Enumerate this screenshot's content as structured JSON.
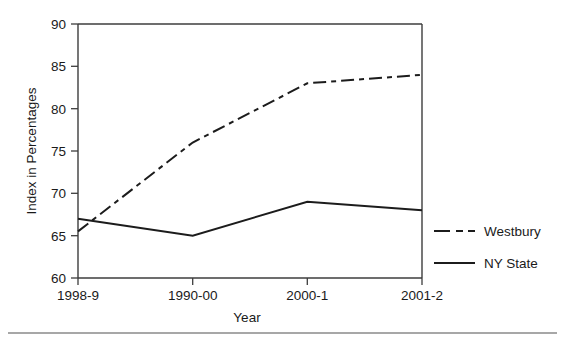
{
  "chart_data": {
    "type": "line",
    "title": "",
    "xlabel": "Year",
    "ylabel": "Index in Percentages",
    "categories": [
      "1998-9",
      "1990-00",
      "2000-1",
      "2001-2"
    ],
    "series": [
      {
        "name": "Westbury",
        "values": [
          65.5,
          76,
          83,
          84
        ],
        "style": "dash-dot",
        "color": "#1c1c1c"
      },
      {
        "name": "NY State",
        "values": [
          67,
          65,
          69,
          68
        ],
        "style": "solid",
        "color": "#1c1c1c"
      }
    ],
    "ylim": [
      60,
      90
    ],
    "yticks": [
      60,
      65,
      70,
      75,
      80,
      85,
      90
    ],
    "grid": false,
    "legend_position": "right-inside-bottom"
  },
  "axes": {
    "y_tick_labels": [
      "90",
      "85",
      "80",
      "75",
      "70",
      "65",
      "60"
    ],
    "x_tick_labels": [
      "1998-9",
      "1990-00",
      "2000-1",
      "2001-2"
    ],
    "y_axis_title": "Index in Percentages",
    "x_axis_title": "Year"
  },
  "legend": {
    "items": [
      {
        "label": "Westbury"
      },
      {
        "label": "NY State"
      }
    ]
  },
  "colors": {
    "line": "#1c1c1c",
    "axis": "#3d3d3d",
    "text": "#1a1a1a",
    "rule": "#8a8a8a",
    "background": "#ffffff"
  }
}
